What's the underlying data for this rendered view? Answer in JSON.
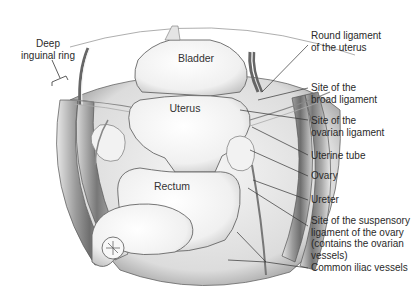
{
  "diagram": {
    "type": "anatomical-illustration",
    "organ_labels": {
      "bladder": "Bladder",
      "uterus": "Uterus",
      "rectum": "Rectum"
    },
    "left_labels": {
      "deep_inguinal_ring": {
        "line1": "Deep",
        "line2": "inguinal ring"
      }
    },
    "right_labels": [
      {
        "id": "round-ligament",
        "line1": "Round ligament",
        "line2": "of the uterus"
      },
      {
        "id": "broad-ligament",
        "line1": "Site of the",
        "line2": "broad ligament"
      },
      {
        "id": "ovarian-ligament",
        "line1": "Site of the",
        "line2": "ovarian ligament"
      },
      {
        "id": "uterine-tube",
        "line1": "Uterine tube"
      },
      {
        "id": "ovary",
        "line1": "Ovary"
      },
      {
        "id": "ureter",
        "line1": "Ureter"
      },
      {
        "id": "suspensory-ligament",
        "line1": "Site of the suspensory",
        "line2": "ligament of the ovary",
        "line3": "(contains the ovarian",
        "line4": "vessels)"
      },
      {
        "id": "common-iliac",
        "line1": "Common iliac vessels"
      }
    ],
    "colors": {
      "line": "#333333",
      "text": "#2a2a2a",
      "shade_dark": "#7a7a7a",
      "shade_mid": "#bdbdbd",
      "shade_light": "#ededed"
    }
  }
}
